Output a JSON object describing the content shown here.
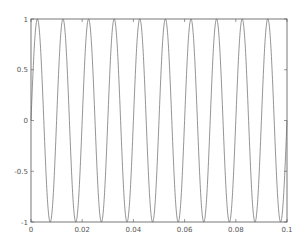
{
  "chart_data": {
    "type": "line",
    "title": "",
    "xlabel": "",
    "ylabel": "",
    "xlim": [
      0,
      0.1
    ],
    "ylim": [
      -1,
      1
    ],
    "grid": false,
    "legend": null,
    "x_ticks": [
      0,
      0.02,
      0.04,
      0.06,
      0.08,
      0.1
    ],
    "x_tick_labels": [
      "0",
      "0.02",
      "0.04",
      "0.06",
      "0.08",
      "0.1"
    ],
    "y_ticks": [
      -1,
      -0.5,
      0,
      0.5,
      1
    ],
    "y_tick_labels": [
      "-1",
      "-0.5",
      "0",
      "0.5",
      "1"
    ],
    "series": [
      {
        "name": "sin(2*pi*100*t)",
        "function": "sine",
        "amplitude": 1,
        "frequency_hz": 100,
        "phase": 0,
        "x_start": 0,
        "x_end": 0.1,
        "color": "#666666"
      }
    ]
  },
  "style": {
    "frame_color": "#555555",
    "line_color": "#666666",
    "background": "#ffffff"
  }
}
